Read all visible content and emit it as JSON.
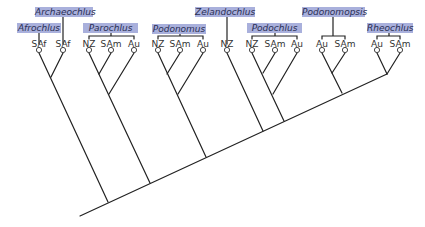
{
  "diagram": {
    "type": "phylogenetic-tree",
    "colors": {
      "label_box": "#a9b0dc",
      "label_text": "#2a2f55",
      "line": "#222222"
    },
    "taxa": [
      {
        "id": "archaeochlus",
        "label": "Archaeochlus",
        "box": [
          35,
          7,
          58
        ]
      },
      {
        "id": "afrochlus",
        "label": "Afrochlus",
        "box": [
          17,
          23,
          44
        ]
      },
      {
        "id": "parochlus",
        "label": "Parochlus",
        "box": [
          83,
          23,
          55
        ]
      },
      {
        "id": "podonomus",
        "label": "Podonomus",
        "box": [
          152,
          24,
          54
        ]
      },
      {
        "id": "zelandochlus",
        "label": "Zelandochlus",
        "box": [
          195,
          7,
          60
        ]
      },
      {
        "id": "podochlus",
        "label": "Podochlus",
        "box": [
          247,
          23,
          55
        ]
      },
      {
        "id": "podonomopsis",
        "label": "Podonomopsis",
        "box": [
          302,
          7,
          63
        ]
      },
      {
        "id": "rheochlus",
        "label": "Rheochlus",
        "box": [
          367,
          23,
          46
        ]
      }
    ],
    "leaves": [
      {
        "label": "SAf",
        "x": 39
      },
      {
        "label": "SAf",
        "x": 63
      },
      {
        "label": "NZ",
        "x": 89
      },
      {
        "label": "SAm",
        "x": 111
      },
      {
        "label": "Au",
        "x": 134
      },
      {
        "label": "NZ",
        "x": 158
      },
      {
        "label": "SAm",
        "x": 180
      },
      {
        "label": "Au",
        "x": 203
      },
      {
        "label": "NZ",
        "x": 227
      },
      {
        "label": "NZ",
        "x": 252
      },
      {
        "label": "SAm",
        "x": 275
      },
      {
        "label": "Au",
        "x": 297
      },
      {
        "label": "Au",
        "x": 322
      },
      {
        "label": "SAm",
        "x": 345
      },
      {
        "label": "Au",
        "x": 377
      },
      {
        "label": "SAm",
        "x": 400
      }
    ]
  }
}
